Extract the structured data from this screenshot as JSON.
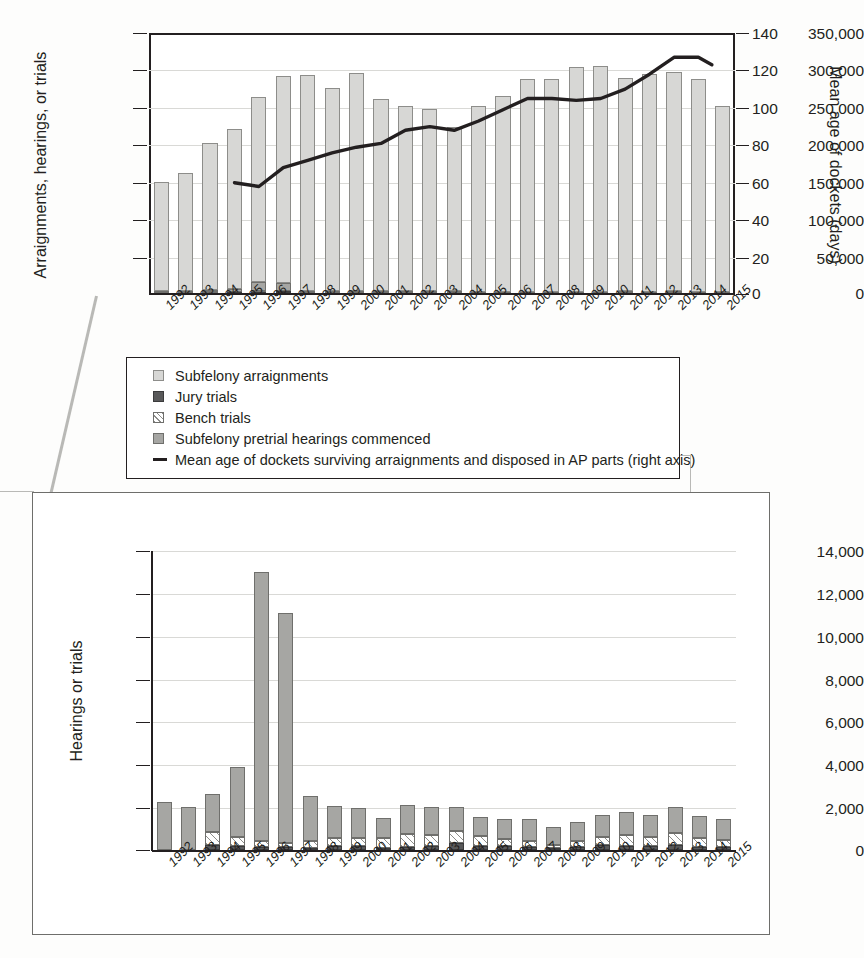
{
  "chart_data": [
    {
      "id": "top",
      "type": "bar",
      "title": "",
      "xlabel": "",
      "ylabel": "Arraignments, hearings, or trials",
      "ylabel_right": "Mean age of dockets (days)",
      "ylim": [
        0,
        350000
      ],
      "yticks": [
        "0",
        "50,000",
        "100,000",
        "150,000",
        "200,000",
        "250,000",
        "300,000",
        "350,000"
      ],
      "ytick_values": [
        0,
        50000,
        100000,
        150000,
        200000,
        250000,
        300000,
        350000
      ],
      "ylim_right": [
        0,
        140
      ],
      "yticks_right": [
        "0",
        "20",
        "40",
        "60",
        "80",
        "100",
        "120",
        "140"
      ],
      "ytick_values_right": [
        0,
        20,
        40,
        60,
        80,
        100,
        120,
        140
      ],
      "grid": true,
      "legend_position": "below-chart",
      "categories": [
        "1992",
        "1993",
        "1994",
        "1995",
        "1996",
        "1997",
        "1998",
        "1999",
        "2000",
        "2001",
        "2002",
        "2003",
        "2004",
        "2005",
        "2006",
        "2007",
        "2008",
        "2009",
        "2010",
        "2011",
        "2012",
        "2013",
        "2014",
        "2015"
      ],
      "series": [
        {
          "name": "Subfelony arraignments",
          "stack": "a",
          "order": 4,
          "values": [
            147000,
            159000,
            199000,
            215000,
            248000,
            278000,
            291000,
            273000,
            293000,
            259000,
            249000,
            245000,
            221000,
            250000,
            263000,
            286000,
            287000,
            303000,
            303000,
            287000,
            293000,
            295000,
            286000,
            250000
          ]
        },
        {
          "name": "Subfelony pretrial hearings commenced",
          "stack": "a",
          "order": 3,
          "values": [
            2200,
            2000,
            2600,
            3900,
            13000,
            11100,
            2500,
            2100,
            2000,
            1500,
            2100,
            2000,
            1800,
            1500,
            1400,
            1400,
            1100,
            1300,
            1500,
            1600,
            1500,
            1700,
            1500,
            1400
          ]
        },
        {
          "name": "Bench trials",
          "stack": "a",
          "order": 2,
          "values": [
            0,
            0,
            700,
            500,
            300,
            200,
            300,
            400,
            400,
            400,
            350,
            300,
            300,
            250,
            200,
            200,
            150,
            200,
            300,
            350,
            300,
            400,
            350,
            300
          ]
        },
        {
          "name": "Jury trials",
          "stack": "a",
          "order": 1,
          "values": [
            150,
            150,
            200,
            1500,
            2000,
            2400,
            300,
            250,
            250,
            200,
            250,
            250,
            200,
            200,
            150,
            150,
            120,
            130,
            150,
            180,
            160,
            180,
            160,
            150
          ]
        }
      ],
      "line_series": {
        "name": "Mean age of dockets surviving arraignments and disposed in AP parts (right axis)",
        "axis": "right",
        "x": [
          "1995",
          "1996",
          "1997",
          "1998",
          "1999",
          "2000",
          "2001",
          "2002",
          "2003",
          "2004",
          "2005",
          "2006",
          "2007",
          "2008",
          "2009",
          "2010",
          "2011",
          "2012",
          "2013",
          "2014"
        ],
        "values": [
          60,
          58,
          68,
          72,
          76,
          79,
          81,
          88,
          90,
          88,
          93,
          99,
          105,
          105,
          104,
          105,
          110,
          118,
          127,
          127,
          123
        ]
      }
    },
    {
      "id": "bottom",
      "type": "bar",
      "title": "",
      "xlabel": "",
      "ylabel": "Hearings or trials",
      "ylim": [
        0,
        14000
      ],
      "yticks": [
        "0",
        "2,000",
        "4,000",
        "6,000",
        "8,000",
        "10,000",
        "12,000",
        "14,000"
      ],
      "ytick_values": [
        0,
        2000,
        4000,
        6000,
        8000,
        10000,
        12000,
        14000
      ],
      "grid": true,
      "categories": [
        "1992",
        "1993",
        "1994",
        "1995",
        "1996",
        "1997",
        "1998",
        "1999",
        "2000",
        "2001",
        "2002",
        "2003",
        "2004",
        "2005",
        "2006",
        "2007",
        "2008",
        "2009",
        "2010",
        "2011",
        "2012",
        "2013",
        "2014",
        "2015"
      ],
      "series": [
        {
          "name": "Subfelony pretrial hearings commenced",
          "stack": "a",
          "order": 3,
          "values": [
            2250,
            2000,
            1750,
            3300,
            12600,
            10800,
            2150,
            1500,
            1400,
            950,
            1350,
            1300,
            1100,
            900,
            950,
            1050,
            850,
            900,
            1050,
            1100,
            1050,
            1200,
            1050,
            1000
          ]
        },
        {
          "name": "Bench trials",
          "stack": "a",
          "order": 2,
          "values": [
            0,
            0,
            620,
            400,
            300,
            200,
            300,
            350,
            350,
            450,
            600,
            500,
            550,
            450,
            300,
            250,
            150,
            250,
            350,
            500,
            400,
            550,
            400,
            300
          ]
        },
        {
          "name": "Jury trials",
          "stack": "a",
          "order": 1,
          "values": [
            0,
            0,
            230,
            200,
            130,
            120,
            100,
            200,
            200,
            100,
            150,
            200,
            350,
            200,
            200,
            150,
            80,
            150,
            250,
            200,
            200,
            250,
            150,
            150
          ]
        }
      ]
    }
  ],
  "top": {
    "ylabel": "Arraignments, hearings, or trials",
    "ylabel_right": "Mean age of dockets (days)",
    "yticks": [
      "350,000",
      "300,000",
      "250,000",
      "200,000",
      "150,000",
      "100,000",
      "50,000",
      "0"
    ],
    "yticks_right": [
      "140",
      "120",
      "100",
      "80",
      "60",
      "40",
      "20",
      "0"
    ],
    "xlabels": [
      "1992",
      "1993",
      "1994",
      "1995",
      "1996",
      "1997",
      "1998",
      "1999",
      "2000",
      "2001",
      "2002",
      "2003",
      "2004",
      "2005",
      "2006",
      "2007",
      "2008",
      "2009",
      "2010",
      "2011",
      "2012",
      "2013",
      "2014",
      "2015"
    ]
  },
  "bottom": {
    "ylabel": "Hearings or trials",
    "yticks": [
      "14,000",
      "12,000",
      "10,000",
      "8,000",
      "6,000",
      "4,000",
      "2,000",
      "0"
    ],
    "xlabels": [
      "1992",
      "1993",
      "1994",
      "1995",
      "1996",
      "1997",
      "1998",
      "1999",
      "2000",
      "2001",
      "2002",
      "2003",
      "2004",
      "2005",
      "2006",
      "2007",
      "2008",
      "2009",
      "2010",
      "2011",
      "2012",
      "2013",
      "2014",
      "2015"
    ]
  },
  "legend": {
    "items": [
      {
        "label": "Subfelony arraignments",
        "marker": "square-light-gray"
      },
      {
        "label": "Jury trials",
        "marker": "square-dark-gray"
      },
      {
        "label": "Bench trials",
        "marker": "square-hatched"
      },
      {
        "label": "Subfelony pretrial hearings commenced",
        "marker": "square-mid-gray"
      },
      {
        "label": "Mean age of dockets surviving arraignments and disposed in AP parts (right axis)",
        "marker": "line-black"
      }
    ]
  },
  "colors": {
    "arraignments": "#d7d7d5",
    "hearings": "#a6a6a3",
    "jury": "#59595a",
    "bench": "#ffffff",
    "line": "#231f20",
    "grid": "#d9d9d6",
    "axis": "#231f20"
  }
}
